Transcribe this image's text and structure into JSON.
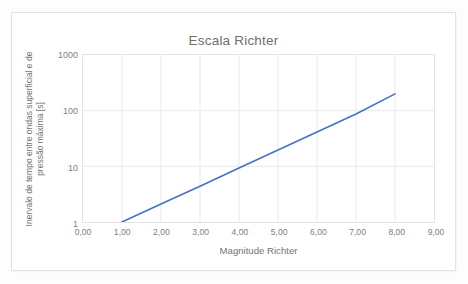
{
  "chart_data": {
    "type": "line",
    "title": "Escala Richter",
    "xlabel": "Magnitude Richter",
    "ylabel": "Inervalo de tempo entre ondas superficial e de pressão máxima [s]",
    "xlim": [
      0,
      9
    ],
    "ylim": [
      1,
      1000
    ],
    "yscale": "log",
    "xscale": "linear",
    "grid": true,
    "legend": false,
    "line_color": "#4472C4",
    "x_tick_labels": [
      "0,00",
      "1,00",
      "2,00",
      "3,00",
      "4,00",
      "5,00",
      "6,00",
      "7,00",
      "8,00",
      "9,00"
    ],
    "x_tick_values": [
      0,
      1,
      2,
      3,
      4,
      5,
      6,
      7,
      8,
      9
    ],
    "y_tick_labels": [
      "1",
      "10",
      "100",
      "1000"
    ],
    "y_tick_values": [
      1,
      10,
      100,
      1000
    ],
    "series": [
      {
        "name": "Escala Richter",
        "x": [
          1.0,
          2.0,
          3.0,
          4.0,
          5.0,
          6.0,
          7.0,
          8.0
        ],
        "values": [
          1.0,
          2.1,
          4.4,
          9.3,
          19.6,
          41.4,
          87.2,
          200.0
        ]
      }
    ]
  }
}
